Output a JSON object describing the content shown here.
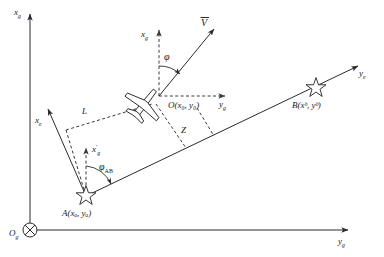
{
  "figure": {
    "type": "geometry-diagram",
    "background_color": "#ffffff",
    "line_color": "#2b2b2b",
    "width": 384,
    "height": 257
  },
  "axes": {
    "vertical_ground": {
      "label": "x",
      "subscript": "g",
      "name": "x_g"
    },
    "horizontal_ground": {
      "label": "y",
      "subscript": "g",
      "name": "y_g"
    },
    "origin": {
      "label": "O",
      "subscript": "g",
      "name": "O_g",
      "symbol": "crossed-circle"
    },
    "path_x": {
      "label": "x",
      "subscript": "e",
      "name": "x_e"
    },
    "path_y": {
      "label": "y",
      "subscript": "e",
      "name": "y_e"
    },
    "body_x_local": {
      "label": "x",
      "subscript": "g",
      "name": "x_g_local"
    },
    "body_y_local": {
      "label": "y",
      "subscript": "g",
      "name": "y_g_local"
    },
    "shifted_x": {
      "label": "x",
      "prime": "′",
      "subscript": "g",
      "name": "x_g_prime"
    }
  },
  "points": {
    "aircraft": {
      "label": "O(x₀, y₀)",
      "name": "O(x0, y0)"
    },
    "waypoint_a": {
      "label": "A(xₐ, yₐ)",
      "name": "A(xa, ya)"
    },
    "waypoint_b": {
      "label": "B(xᵇ, yᵇ)",
      "name": "B(xb, yb)"
    }
  },
  "vectors": {
    "velocity": {
      "label": "V",
      "name": "velocity-vector",
      "overbar": true
    }
  },
  "angles": {
    "heading": {
      "label": "φ",
      "name": "phi"
    },
    "path_bearing": {
      "label": "φ",
      "subscript": "AB",
      "name": "phi_AB"
    }
  },
  "distances": {
    "lateral_offset": {
      "label": "L",
      "name": "L"
    },
    "cross_track": {
      "label": "Z",
      "name": "Z"
    }
  }
}
